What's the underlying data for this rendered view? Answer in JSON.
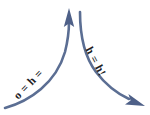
{
  "figure": {
    "type": "diagram",
    "background_color": "#ffffff",
    "width": 150,
    "height": 115,
    "stroke_color": "#5b6e93",
    "label_color": "#1d1d1f"
  },
  "arrows": [
    {
      "name": "ascending-arrow",
      "label": "o = h =",
      "direction": "up-right",
      "arrowhead": "top-center",
      "start": "bottom-left",
      "end": "top-center",
      "color": "#5b6e93"
    },
    {
      "name": "descending-arrow",
      "label": "h = h!",
      "direction": "down-right",
      "arrowhead": "bottom-right",
      "start": "top-center",
      "end": "bottom-right",
      "color": "#5b6e93"
    }
  ]
}
